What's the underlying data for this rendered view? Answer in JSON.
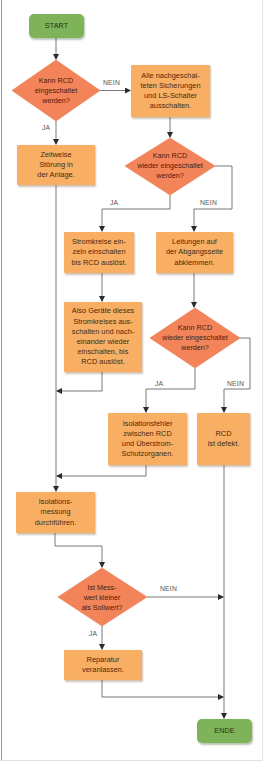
{
  "colors": {
    "terminal": "#7fb35a",
    "process": "#f8ae63",
    "decision": "#f3845a",
    "connector": "#5a5a5a"
  },
  "nodes": {
    "start": {
      "label": "START"
    },
    "d1": {
      "label": "Kann RCD\neingeschaltet\nwerden?"
    },
    "p_alle": {
      "label": "Alle nachgeschal-\nteten Sicherungen\nund LS-Schalter\nausschalten."
    },
    "p_zeitweise": {
      "label": "Zeitweise\nStörung in\nder Anlage."
    },
    "d2": {
      "label": "Kann RCD\nwieder eingeschaltet\nwerden?"
    },
    "p_stromkreise": {
      "label": "Stromkreise ein-\nzeln einschalten\nbis RCD auslöst."
    },
    "p_leitungen": {
      "label": "Leitungen auf\nder Abgangsseite\nabklemmen."
    },
    "p_geraete": {
      "label": "Also Geräte dieses\nStromkreises aus-\nschalten und nach-\neinander wieder\neinschalten, bis\nRCD auslöst."
    },
    "d3": {
      "label": "Kann RCD\nwieder eingeschaltet\nwerden?"
    },
    "p_isolationsfehler": {
      "label": "Isolationsfehler\nzwischen RCD\nund Überstrom-\nSchutzorganen."
    },
    "p_defekt": {
      "label": "RCD\nist defekt."
    },
    "p_messung": {
      "label": "Isolations-\nmessung\ndurchführen."
    },
    "d4": {
      "label": "Ist Mess-\nwert kleiner\nals Sollwert?"
    },
    "p_reparatur": {
      "label": "Reparatur\nveranlassen."
    },
    "ende": {
      "label": "ENDE"
    }
  },
  "edge_labels": {
    "d1_nein": "NEIN",
    "d1_ja": "JA",
    "d2_ja": "JA",
    "d2_nein": "NEIN",
    "d3_ja": "JA",
    "d3_nein": "NEIN",
    "d4_nein": "NEIN",
    "d4_ja": "JA"
  }
}
